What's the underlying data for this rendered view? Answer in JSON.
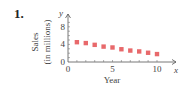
{
  "problem_number": "1.",
  "chart_data": {
    "type": "scatter",
    "title": "",
    "xlabel": "Year",
    "ylabel": "Sales (in millions)",
    "x_axis_symbol": "x",
    "y_axis_symbol": "y",
    "x": [
      1,
      2,
      3,
      4,
      5,
      6,
      7,
      8,
      9,
      10
    ],
    "series": [
      {
        "name": "Sales",
        "values": [
          4.5,
          4.3,
          3.9,
          3.5,
          3.3,
          2.9,
          2.6,
          2.4,
          2.1,
          1.8
        ],
        "color": "#e8696b"
      }
    ],
    "x_ticks": [
      "0",
      "5",
      "10"
    ],
    "y_ticks": [
      "0",
      "4",
      "8"
    ],
    "xlim": [
      0,
      11
    ],
    "ylim": [
      0,
      10
    ],
    "grid": false,
    "legend": "none"
  }
}
